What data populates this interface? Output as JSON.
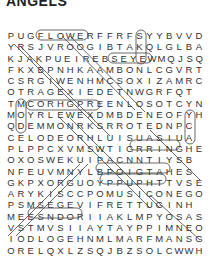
{
  "puzzle": {
    "title": "ANGELS",
    "grid": [
      "PUGFLOWERFFRFSYYBVVD",
      "YRSJVROOGIBTAKQLGLBA",
      "KJAKPUEIREBSEYEWMQJSQ",
      "FKXBPNHKAAMBONLCGVRT",
      "CSRGIWENHMCSOXIZAMRC",
      "OTRAGEXIEDETNWGRFQT",
      "TMCORHGPREENLOSOTCYN",
      "MOYRLEWEXDMBDENEOFYH",
      "QDEMMONRKSRROTEDNPC",
      "CELODEORHLUISUASIUA",
      "PLPPCXVMSWTIGRRINGHE",
      "OXOSWEKUIPACNNTIYSB",
      "NFEUVMNYLBPOIGTAHES",
      "GKPXORGUOYPPUPHTTVSE",
      "ARYKISCCPOMUSICONEGO",
      "PSMSEGEVIFRETTUGINH",
      "MEESNDORIIAKLMPYOSAS",
      "VSTMVSIIAYTAYPPIMNEO",
      "IODLOGEHNMLMARFMANSG",
      "ORELQXLZSQJBZSOLCWWH"
    ]
  }
}
